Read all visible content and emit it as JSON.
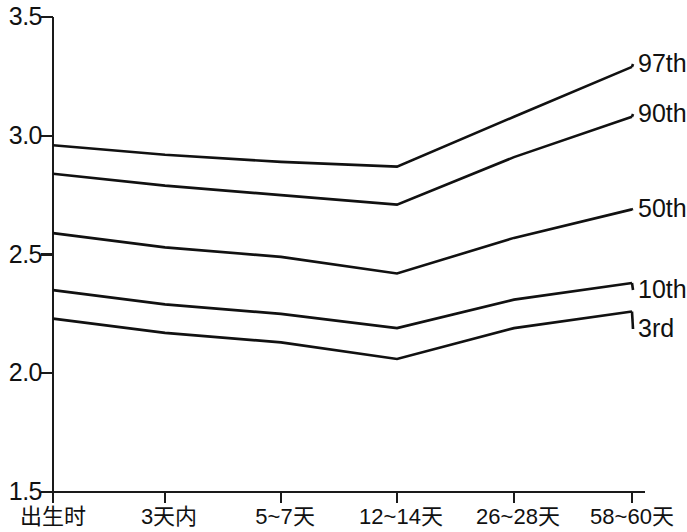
{
  "chart_data": {
    "type": "line",
    "title": "",
    "subtitle": "",
    "xlabel": "",
    "ylabel": "",
    "grid": false,
    "legend_position": "right-inline",
    "ylim": [
      1.5,
      3.5
    ],
    "y_ticks": [
      "3.5",
      "3.0",
      "2.5",
      "2.0",
      "1.5"
    ],
    "y_tick_values": [
      3.5,
      3.0,
      2.5,
      2.0,
      1.5
    ],
    "categories": [
      "出生时",
      "3天内",
      "5~7天",
      "12~14天",
      "26~28天",
      "58~60天"
    ],
    "series": [
      {
        "name": "97th",
        "values": [
          2.96,
          2.92,
          2.89,
          2.87,
          3.08,
          3.29
        ]
      },
      {
        "name": "90th",
        "values": [
          2.84,
          2.79,
          2.75,
          2.71,
          2.91,
          3.08
        ]
      },
      {
        "name": "50th",
        "values": [
          2.59,
          2.53,
          2.49,
          2.42,
          2.57,
          2.69
        ]
      },
      {
        "name": "10th",
        "values": [
          2.35,
          2.29,
          2.25,
          2.19,
          2.31,
          2.38
        ]
      },
      {
        "name": "3rd",
        "values": [
          2.23,
          2.17,
          2.13,
          2.06,
          2.19,
          2.26
        ]
      }
    ]
  },
  "legend": {
    "items": [
      {
        "label": "97th"
      },
      {
        "label": "90th"
      },
      {
        "label": "50th"
      },
      {
        "label": "10th"
      },
      {
        "label": "3rd"
      }
    ]
  },
  "axes": {
    "y_labels": [
      {
        "text": "3.5"
      },
      {
        "text": "3.0"
      },
      {
        "text": "2.5"
      },
      {
        "text": "2.0"
      },
      {
        "text": "1.5"
      }
    ],
    "x_labels": [
      {
        "text": "出生时"
      },
      {
        "text": "3天内"
      },
      {
        "text": "5~7天"
      },
      {
        "text": "12~14天"
      },
      {
        "text": "26~28天"
      },
      {
        "text": "58~60天"
      }
    ]
  },
  "style": {
    "line_color": "#111111",
    "axis_color": "#1a1a1a",
    "background": "#ffffff"
  }
}
